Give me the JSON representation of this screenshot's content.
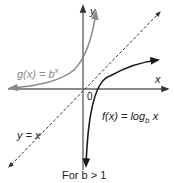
{
  "figure": {
    "caption": "For b > 1",
    "axes": {
      "x_label": "x",
      "y_label": "y",
      "origin_label": "0"
    },
    "curves": [
      {
        "name": "exponential",
        "label_fn": "g(x) = b",
        "label_exp": "x",
        "color": "#8a8a8a"
      },
      {
        "name": "logarithm",
        "label_fn": "f(x) = log",
        "label_sub": "b",
        "label_var": "x",
        "color": "#1a1a1a"
      },
      {
        "name": "identity",
        "label": "y = x",
        "style": "dashed",
        "color": "#333333"
      }
    ]
  }
}
